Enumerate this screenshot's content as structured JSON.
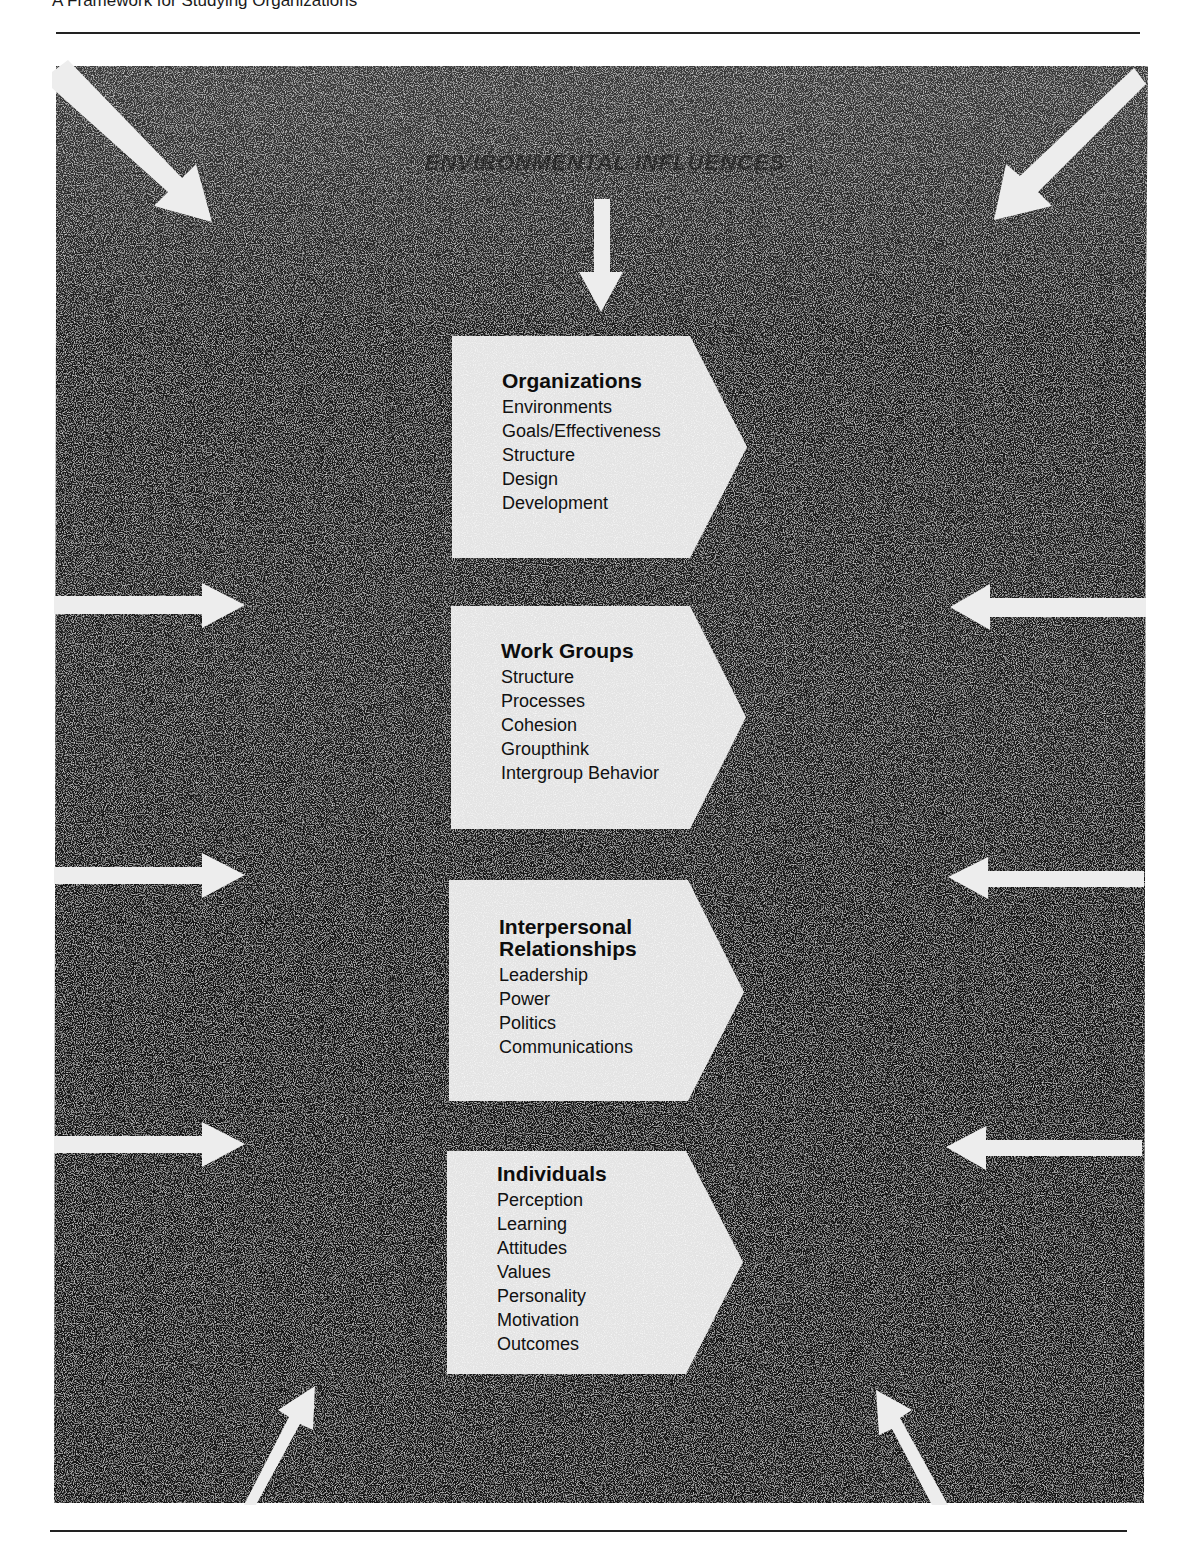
{
  "page": {
    "header": "A Framework for Studying Organizations"
  },
  "diagram": {
    "title": "ENVIRONMENTAL INFLUENCES",
    "colors": {
      "panel": "#141414",
      "box": "#e8e8e8",
      "arrows": "#eeeeee",
      "text": "#111111"
    },
    "boxes": [
      {
        "title": "Organizations",
        "items": [
          "Environments",
          "Goals/Effectiveness",
          "Structure",
          "Design",
          "Development"
        ]
      },
      {
        "title": "Work Groups",
        "items": [
          "Structure",
          "Processes",
          "Cohesion",
          "Groupthink",
          "Intergroup Behavior"
        ]
      },
      {
        "title_line1": "Interpersonal",
        "title_line2": "Relationships",
        "items": [
          "Leadership",
          "Power",
          "Politics",
          "Communications"
        ]
      },
      {
        "title": "Individuals",
        "items": [
          "Perception",
          "Learning",
          "Attitudes",
          "Values",
          "Personality",
          "Motivation",
          "Outcomes"
        ]
      }
    ],
    "arrows": [
      "arrow-top-left-diagonal",
      "arrow-top-center-down",
      "arrow-top-right-diagonal",
      "arrow-left-1",
      "arrow-left-2",
      "arrow-left-3",
      "arrow-right-1",
      "arrow-right-2",
      "arrow-right-3",
      "arrow-bottom-left-diagonal",
      "arrow-bottom-right-diagonal"
    ]
  }
}
